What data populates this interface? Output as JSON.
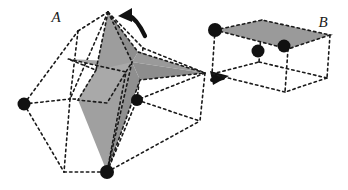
{
  "figure": {
    "background_color": "#ffffff",
    "ink_color": "#1a1a1a",
    "shade_color_light": "#a8a8a8",
    "shade_color_mid": "#999999",
    "shade_color_dark": "#8a8a8a",
    "vertex_color": "#111111"
  },
  "labels": {
    "left_object": "A",
    "right_object": "B"
  },
  "objects": {
    "left": {
      "name": "A",
      "description": "stellated star polytope inside dashed polyhedral cage",
      "label_position": {
        "x": 56,
        "y": 22
      },
      "shaded_faces": [
        {
          "name": "upper-spike-left",
          "points": "108,12 96,70 132,62",
          "fill": "#9d9d9d"
        },
        {
          "name": "upper-spike-right",
          "points": "108,12 132,62 138,52",
          "fill": "#8e8e8e"
        },
        {
          "name": "left-barb",
          "points": "68,59 132,62 126,72",
          "fill": "#a6a6a6"
        },
        {
          "name": "right-barb-upper",
          "points": "132,62 205,73 138,52",
          "fill": "#9a9a9a"
        },
        {
          "name": "right-barb-lower",
          "points": "132,62 205,73 140,80",
          "fill": "#8d8d8d"
        },
        {
          "name": "lower-body-left",
          "points": "96,70 132,62 107,172 78,100",
          "fill": "#a0a0a0"
        },
        {
          "name": "lower-body-right",
          "points": "132,62 140,80 107,172",
          "fill": "#8f8f8f"
        },
        {
          "name": "core-facet",
          "points": "96,70 78,100 107,103 132,62",
          "fill": "#a9a9a9"
        }
      ],
      "cage_edges": [
        {
          "from": [
            24,
            104
          ],
          "to": [
            70,
            99
          ]
        },
        {
          "from": [
            24,
            104
          ],
          "to": [
            64,
            172
          ]
        },
        {
          "from": [
            24,
            104
          ],
          "to": [
            78,
            31
          ]
        },
        {
          "from": [
            78,
            31
          ],
          "to": [
            108,
            12
          ]
        },
        {
          "from": [
            78,
            31
          ],
          "to": [
            70,
            99
          ]
        },
        {
          "from": [
            108,
            12
          ],
          "to": [
            143,
            48
          ]
        },
        {
          "from": [
            108,
            12
          ],
          "to": [
            70,
            99
          ]
        },
        {
          "from": [
            143,
            48
          ],
          "to": [
            205,
            73
          ]
        },
        {
          "from": [
            143,
            48
          ],
          "to": [
            137,
            100
          ]
        },
        {
          "from": [
            205,
            73
          ],
          "to": [
            137,
            100
          ]
        },
        {
          "from": [
            205,
            73
          ],
          "to": [
            200,
            121
          ]
        },
        {
          "from": [
            137,
            100
          ],
          "to": [
            200,
            121
          ]
        },
        {
          "from": [
            137,
            100
          ],
          "to": [
            70,
            99
          ]
        },
        {
          "from": [
            70,
            99
          ],
          "to": [
            64,
            172
          ]
        },
        {
          "from": [
            64,
            172
          ],
          "to": [
            107,
            172
          ]
        },
        {
          "from": [
            107,
            172
          ],
          "to": [
            137,
            100
          ]
        },
        {
          "from": [
            107,
            172
          ],
          "to": [
            200,
            121
          ]
        },
        {
          "from": [
            200,
            121
          ],
          "to": [
            137,
            100
          ]
        }
      ],
      "vertices": [
        {
          "name": "left-outer-vertex",
          "x": 24,
          "y": 104,
          "r": 6.5
        },
        {
          "name": "center-right-vertex",
          "x": 137,
          "y": 100,
          "r": 6.0
        },
        {
          "name": "bottom-vertex",
          "x": 107,
          "y": 172,
          "r": 7.0
        }
      ]
    },
    "right": {
      "name": "B",
      "description": "parallelepiped with shaded top face",
      "label_position": {
        "x": 323,
        "y": 27
      },
      "top_face": {
        "name": "top-parallelogram",
        "points": "215,30 262,20 330,35 288,49",
        "fill": "#9a9a9a"
      },
      "cage_edges": [
        {
          "from": [
            215,
            30
          ],
          "to": [
            262,
            20
          ]
        },
        {
          "from": [
            262,
            20
          ],
          "to": [
            330,
            35
          ]
        },
        {
          "from": [
            330,
            35
          ],
          "to": [
            288,
            49
          ]
        },
        {
          "from": [
            288,
            49
          ],
          "to": [
            215,
            30
          ]
        },
        {
          "from": [
            215,
            30
          ],
          "to": [
            212,
            74
          ]
        },
        {
          "from": [
            262,
            20
          ],
          "to": [
            259,
            62
          ]
        },
        {
          "from": [
            330,
            35
          ],
          "to": [
            327,
            78
          ]
        },
        {
          "from": [
            288,
            49
          ],
          "to": [
            285,
            92
          ]
        },
        {
          "from": [
            212,
            74
          ],
          "to": [
            259,
            62
          ]
        },
        {
          "from": [
            259,
            62
          ],
          "to": [
            327,
            78
          ]
        },
        {
          "from": [
            327,
            78
          ],
          "to": [
            285,
            92
          ]
        },
        {
          "from": [
            285,
            92
          ],
          "to": [
            212,
            74
          ]
        }
      ],
      "vertices": [
        {
          "name": "top-left-vertex",
          "x": 215,
          "y": 30,
          "r": 7.0
        },
        {
          "name": "inner-mid-vertex",
          "x": 258,
          "y": 51,
          "r": 6.5
        },
        {
          "name": "front-right-vertex",
          "x": 284,
          "y": 46,
          "r": 6.5
        }
      ]
    }
  },
  "arrows": [
    {
      "name": "rotation-arrow",
      "kind": "curved",
      "description": "curved arrow above left polytope indicating rotation",
      "path": "M 144 34 C 138 22 132 17 127 15",
      "head": "131,10 120,15 131,21",
      "color": "#111111"
    },
    {
      "name": "transform-arrow",
      "kind": "straight",
      "description": "short solid arrow pointing right between the two objects",
      "path": "M 210 80 L 224 78",
      "head": "228,77 211,72 213,84",
      "color": "#111111"
    }
  ]
}
